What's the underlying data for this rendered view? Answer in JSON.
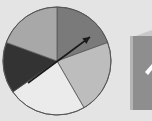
{
  "figure": {
    "background": "#e4e4e4",
    "spinner": {
      "center": [
        57,
        61
      ],
      "radius": 54,
      "outline_color": "#555555",
      "sectors": [
        {
          "name": "top-right",
          "start_deg": 0,
          "end_deg": 70,
          "color": "#7a7a7a"
        },
        {
          "name": "right",
          "start_deg": 70,
          "end_deg": 150,
          "color": "#bdbdbd"
        },
        {
          "name": "bottom",
          "start_deg": 150,
          "end_deg": 235,
          "color": "#ebebeb"
        },
        {
          "name": "left",
          "start_deg": 235,
          "end_deg": 290,
          "color": "#333333"
        },
        {
          "name": "top-left",
          "start_deg": 290,
          "end_deg": 360,
          "color": "#a8a8a8"
        }
      ],
      "arrow": {
        "from": [
          28,
          83
        ],
        "to": [
          90,
          37
        ],
        "color": "#1a1a1a"
      }
    },
    "cube": {
      "front_color": "#8c8c8c",
      "top_color": "#c8c8c8",
      "mark_color": "#ffffff"
    }
  }
}
